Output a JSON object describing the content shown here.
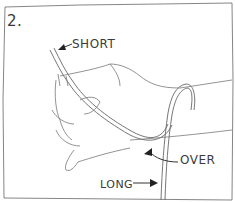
{
  "illustration": {
    "step_number": "2.",
    "labels": {
      "short": "SHORT",
      "over": "OVER",
      "long": "LONG"
    },
    "stroke_color": "#555555",
    "background": "#ffffff"
  }
}
